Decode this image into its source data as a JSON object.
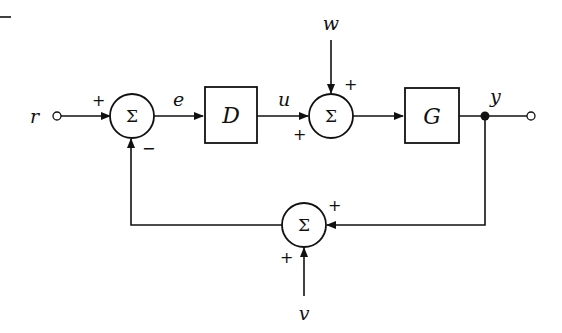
{
  "diagram": {
    "type": "feedback-control-block-diagram",
    "inputs": {
      "reference": "r",
      "disturbance": "w",
      "sensor_noise": "v"
    },
    "signals": {
      "error": "e",
      "control": "u",
      "output": "y"
    },
    "blocks": {
      "controller": "D",
      "plant": "G"
    },
    "summing_junctions": [
      {
        "id": "sum1",
        "symbol": "Σ",
        "signs": {
          "left": "+",
          "bottom": "−"
        }
      },
      {
        "id": "sum2",
        "symbol": "Σ",
        "signs": {
          "top": "+",
          "left": "+"
        }
      },
      {
        "id": "sum3",
        "symbol": "Σ",
        "signs": {
          "right": "+",
          "bottom": "+"
        }
      }
    ],
    "colors": {
      "stroke": "#111111",
      "background": "#ffffff"
    }
  }
}
